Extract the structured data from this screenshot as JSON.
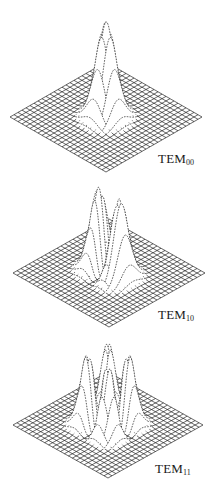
{
  "figure": {
    "width": 219,
    "height": 497,
    "background": "#ffffff",
    "ink_color": "#1a1a1a",
    "grid_cells": 24,
    "panels": [
      {
        "id": "tem00",
        "label_main": "TEM",
        "label_sub": "00",
        "mode_m": 0,
        "mode_n": 0,
        "center": [
          106,
          117
        ],
        "half_width": 96,
        "half_height": 55,
        "peak_height": 95,
        "label_pos": [
          158,
          151
        ]
      },
      {
        "id": "tem10",
        "label_main": "TEM",
        "label_sub": "10",
        "mode_m": 1,
        "mode_n": 0,
        "center": [
          109,
          273
        ],
        "half_width": 96,
        "half_height": 54,
        "peak_height": 80,
        "label_pos": [
          158,
          307
        ]
      },
      {
        "id": "tem11",
        "label_main": "TEM",
        "label_sub": "11",
        "mode_m": 1,
        "mode_n": 1,
        "center": [
          108,
          425
        ],
        "half_width": 95,
        "half_height": 53,
        "peak_height": 72,
        "label_pos": [
          155,
          461
        ]
      }
    ]
  }
}
